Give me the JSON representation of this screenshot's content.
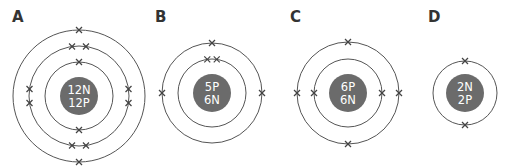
{
  "diagram": {
    "title": "",
    "colors": {
      "background": "#ffffff",
      "ring": "#555555",
      "nucleus": "#6b6b6b",
      "nucleus_text": "#ffffff",
      "label": "#333333",
      "electron": "#444444"
    },
    "atoms": [
      {
        "id": "A",
        "label": "A",
        "label_pos": [
          12,
          22
        ],
        "center": [
          79,
          96
        ],
        "nucleus_radius": 19,
        "nucleus_lines": [
          "12N",
          "12P"
        ],
        "shells": [
          {
            "radius": 34,
            "electrons": 2,
            "angles": [
              -90,
              90
            ]
          },
          {
            "radius": 50,
            "electrons": 8,
            "angles": [
              -98,
              -82,
              82,
              98,
              172,
              188,
              -8,
              8
            ]
          },
          {
            "radius": 66,
            "electrons": 2,
            "angles": [
              -90,
              90
            ]
          }
        ]
      },
      {
        "id": "B",
        "label": "B",
        "label_pos": [
          155,
          22
        ],
        "center": [
          212,
          93
        ],
        "nucleus_radius": 19,
        "nucleus_lines": [
          "5P",
          "6N"
        ],
        "shells": [
          {
            "radius": 34,
            "electrons": 2,
            "angles": [
              -98,
              -82
            ]
          },
          {
            "radius": 50,
            "electrons": 3,
            "angles": [
              -90,
              180,
              0
            ]
          }
        ]
      },
      {
        "id": "C",
        "label": "C",
        "label_pos": [
          290,
          22
        ],
        "center": [
          348,
          93
        ],
        "nucleus_radius": 19,
        "nucleus_lines": [
          "6P",
          "6N"
        ],
        "shells": [
          {
            "radius": 34,
            "electrons": 2,
            "angles": [
              180,
              0
            ]
          },
          {
            "radius": 51,
            "electrons": 4,
            "angles": [
              -90,
              90,
              180,
              0
            ]
          }
        ]
      },
      {
        "id": "D",
        "label": "D",
        "label_pos": [
          428,
          22
        ],
        "center": [
          465,
          93
        ],
        "nucleus_radius": 19,
        "nucleus_lines": [
          "2N",
          "2P"
        ],
        "shells": [
          {
            "radius": 32,
            "electrons": 2,
            "angles": [
              -90,
              90
            ]
          }
        ]
      }
    ]
  }
}
